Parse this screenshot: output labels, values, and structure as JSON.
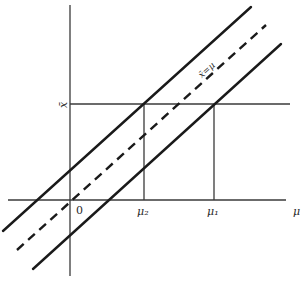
{
  "diagram": {
    "type": "confidence-band-diagram",
    "horizontal_axis_label": "μ",
    "vertical_axis_label": "x̄",
    "origin_label": "0",
    "tick_labels": {
      "mu2": "μ₂",
      "mu1": "μ₁"
    },
    "diagonal_label": "x̄=μ",
    "lines": [
      {
        "name": "upper-bound-line",
        "style": "solid"
      },
      {
        "name": "identity-line",
        "style": "dashed",
        "label": "x̄=μ"
      },
      {
        "name": "lower-bound-line",
        "style": "solid"
      }
    ],
    "guides": [
      {
        "name": "xbar-level-line",
        "description": "horizontal line at observed x̄"
      },
      {
        "name": "mu2-drop-line",
        "description": "vertical line at μ₂"
      },
      {
        "name": "mu1-drop-line",
        "description": "vertical line at μ₁"
      }
    ]
  }
}
